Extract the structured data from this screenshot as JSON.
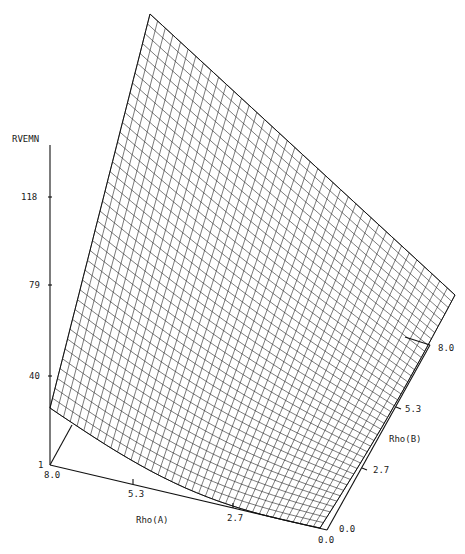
{
  "chart_data": {
    "type": "surface3d",
    "title": "",
    "zlabel": "RVEMN",
    "xlabel": "Rho(A)",
    "ylabel": "Rho(B)",
    "z_ticks": [
      "118",
      "79",
      "40",
      "1"
    ],
    "x_ticks": [
      "8.0",
      "5.3",
      "2.7",
      "0.0"
    ],
    "y_ticks": [
      "0.0",
      "2.7",
      "5.3",
      "8.0"
    ],
    "zlim": [
      1,
      118
    ],
    "xlim": [
      0.0,
      8.0
    ],
    "ylim": [
      0.0,
      8.0
    ],
    "grid": false,
    "mesh_resolution": 40,
    "corner_values": {
      "rhoA_0_rhoB_0": 1,
      "rhoA_8_rhoB_0": 30,
      "rhoA_0_rhoB_8": 60,
      "rhoA_8_rhoB_8": 160
    }
  },
  "axis": {
    "z_label": "RVEMN",
    "z_ticks": [
      {
        "label": "118",
        "y": 197
      },
      {
        "label": "79",
        "y": 285
      },
      {
        "label": "40",
        "y": 376
      },
      {
        "label": "1",
        "y": 465
      }
    ],
    "x_label": "Rho(A)",
    "x_ticks": [
      {
        "label": "8.0"
      },
      {
        "label": "5.3"
      },
      {
        "label": "2.7"
      },
      {
        "label": "0.0"
      }
    ],
    "y_label": "Rho(B)",
    "y_ticks": [
      {
        "label": "0.0"
      },
      {
        "label": "2.7"
      },
      {
        "label": "5.3"
      },
      {
        "label": "8.0"
      }
    ]
  }
}
